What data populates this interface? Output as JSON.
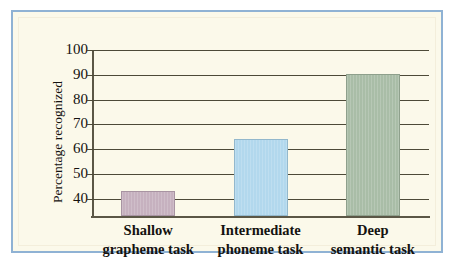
{
  "figure": {
    "frame_color": "#8fb2d4",
    "background_color": "#fbf9ea"
  },
  "chart_data": {
    "type": "bar",
    "title": "",
    "subtitle": "",
    "xlabel": "",
    "ylabel": "Percentage recognized",
    "categories": [
      "Shallow grapheme task",
      "Intermediate phoneme task",
      "Deep semantic task"
    ],
    "category_lines": [
      [
        "Shallow",
        "grapheme task"
      ],
      [
        "Intermediate",
        "phoneme task"
      ],
      [
        "Deep",
        "semantic task"
      ]
    ],
    "values": [
      43,
      64,
      90.5
    ],
    "ylim": [
      33,
      100
    ],
    "yticks": [
      100,
      90,
      80,
      70,
      60,
      50,
      40
    ],
    "ytick_labels": [
      "100",
      "90",
      "80",
      "70",
      "60",
      "50",
      "40"
    ],
    "grid": true,
    "grid_axis": "y",
    "legend": false,
    "bar_colors": [
      "#c6b1bf",
      "#b2d8ed",
      "#a9bda7"
    ],
    "bar_edge_colors": [
      "#a894a2",
      "#93b8cc",
      "#8ea08c"
    ],
    "axis_color": "#5b5746",
    "gridline_color": "#4d4a38",
    "text_color": "#141210"
  }
}
